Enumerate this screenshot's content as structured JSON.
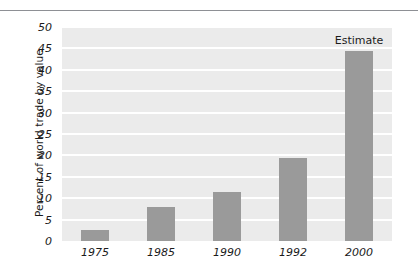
{
  "chart_data": {
    "type": "bar",
    "title": "",
    "subtitle": "",
    "xlabel": "",
    "ylabel": "Percent of world trade by value",
    "categories": [
      "1975",
      "1985",
      "1990",
      "1992",
      "2000"
    ],
    "values": [
      2.5,
      8,
      11.5,
      19.5,
      44.5
    ],
    "series": [
      {
        "name": "Percent of world trade by value",
        "values": [
          2.5,
          8,
          11.5,
          19.5,
          44.5
        ]
      }
    ],
    "ylim": [
      0,
      50
    ],
    "yticks": [
      "0",
      "5",
      "10",
      "15",
      "20",
      "25",
      "30",
      "35",
      "40",
      "45",
      "50"
    ],
    "ytick_values": [
      0,
      5,
      10,
      15,
      20,
      25,
      30,
      35,
      40,
      45,
      50
    ],
    "grid": true,
    "grid_orientation": "horizontal",
    "legend": false,
    "legend_position": "none",
    "annotations": [
      {
        "text": "Estimate",
        "category": "2000",
        "position": "above-bar"
      }
    ],
    "colors": {
      "bar": "#9a9a9a",
      "plot_background": "#ebebeb",
      "gridline": "#ffffff",
      "text": "#1b1b1b",
      "rule": "#8e9095",
      "figure_background": "#ffffff"
    }
  }
}
